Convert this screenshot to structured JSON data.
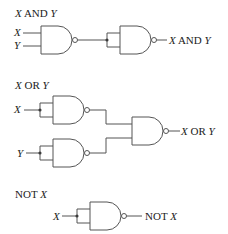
{
  "diagram": {
    "sections": [
      {
        "id": "and",
        "heading_var1": "X",
        "heading_op": " AND ",
        "heading_var2": "Y",
        "inputs": [
          "X",
          "Y"
        ],
        "output_var1": "X",
        "output_op": " AND ",
        "output_var2": "Y"
      },
      {
        "id": "or",
        "heading_var1": "X",
        "heading_op": " OR ",
        "heading_var2": "Y",
        "inputs": [
          "X",
          "Y"
        ],
        "output_var1": "X",
        "output_op": " OR ",
        "output_var2": "Y"
      },
      {
        "id": "not",
        "heading_op": "NOT ",
        "heading_var": "X",
        "inputs": [
          "X"
        ],
        "output_op": "NOT ",
        "output_var": "X"
      }
    ],
    "colors": {
      "line": "#555555",
      "text": "#222222",
      "background": "#ffffff"
    }
  }
}
